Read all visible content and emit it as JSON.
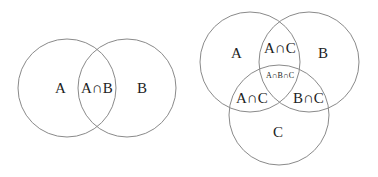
{
  "two_set": {
    "labels": {
      "a": "A",
      "ab": "A∩B",
      "b": "B"
    }
  },
  "three_set": {
    "labels": {
      "a": "A",
      "ac_top": "A∩C",
      "b": "B",
      "abc": "A∩B∩C",
      "ac_bottom": "A∩C",
      "bc": "B∩C",
      "c": "C"
    }
  },
  "colors": {
    "stroke": "#8a8a8a",
    "text": "#222222"
  }
}
